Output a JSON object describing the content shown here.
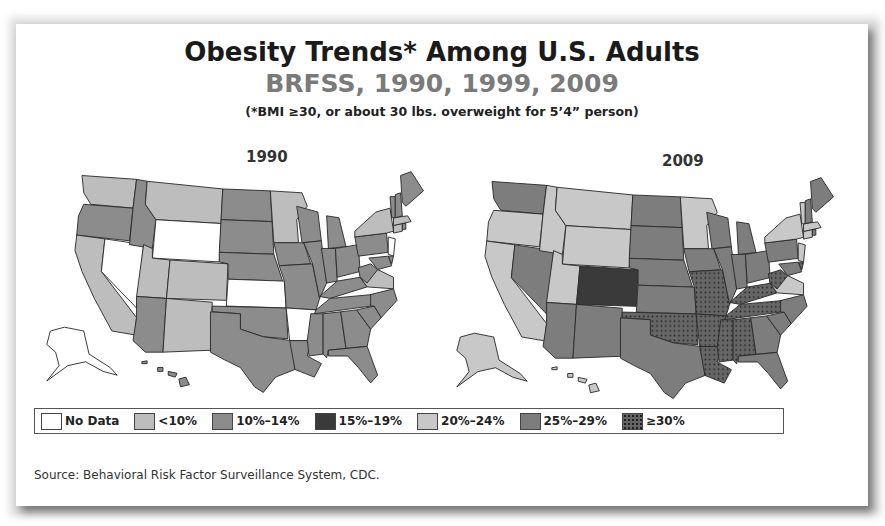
{
  "slide": {
    "title": "Obesity Trends* Among U.S. Adults",
    "subtitle": "BRFSS, 1990, 1999, 2009",
    "note": "(*BMI ≥30, or about 30 lbs. overweight for 5’4” person)",
    "source": "Source: Behavioral Risk Factor Surveillance System, CDC."
  },
  "colors": {
    "no_data": "#ffffff",
    "lt10": "#bdbdbd",
    "10_14": "#8c8c8c",
    "15_19": "#3a3a3a",
    "20_24": "#c8c8c8",
    "25_29": "#7d7d7d",
    "gte30": "#555555"
  },
  "chart_data": {
    "type": "choropleth",
    "title": "Obesity Trends* Among U.S. Adults",
    "subtitle": "BRFSS, 1990, 1999, 2009",
    "note": "(*BMI ≥30, or about 30 lbs. overweight for 5’4” person)",
    "legend": [
      {
        "key": "no_data",
        "label": "No Data"
      },
      {
        "key": "lt10",
        "label": "<10%"
      },
      {
        "key": "10_14",
        "label": "10%–14%"
      },
      {
        "key": "15_19",
        "label": "15%–19%"
      },
      {
        "key": "20_24",
        "label": "20%–24%"
      },
      {
        "key": "25_29",
        "label": "25%–29%"
      },
      {
        "key": "gte30",
        "label": "≥30%"
      }
    ],
    "maps": [
      {
        "year": "1990",
        "states": {
          "WA": "lt10",
          "OR": "10_14",
          "CA": "lt10",
          "NV": "no_data",
          "ID": "10_14",
          "MT": "lt10",
          "WY": "no_data",
          "UT": "lt10",
          "CO": "lt10",
          "AZ": "10_14",
          "NM": "lt10",
          "ND": "10_14",
          "SD": "10_14",
          "NE": "10_14",
          "KS": "no_data",
          "OK": "10_14",
          "TX": "10_14",
          "MN": "lt10",
          "IA": "10_14",
          "MO": "10_14",
          "AR": "no_data",
          "LA": "10_14",
          "WI": "10_14",
          "IL": "10_14",
          "MI": "10_14",
          "IN": "10_14",
          "OH": "10_14",
          "KY": "10_14",
          "TN": "10_14",
          "MS": "10_14",
          "AL": "10_14",
          "GA": "10_14",
          "FL": "10_14",
          "SC": "10_14",
          "NC": "10_14",
          "VA": "lt10",
          "WV": "10_14",
          "PA": "10_14",
          "NY": "lt10",
          "NJ": "no_data",
          "DE": "10_14",
          "MD": "10_14",
          "CT": "lt10",
          "RI": "10_14",
          "MA": "lt10",
          "VT": "10_14",
          "NH": "10_14",
          "ME": "10_14",
          "AK": "no_data",
          "HI": "10_14"
        }
      },
      {
        "year": "2009",
        "states": {
          "WA": "25_29",
          "OR": "20_24",
          "CA": "20_24",
          "NV": "25_29",
          "ID": "20_24",
          "MT": "20_24",
          "WY": "20_24",
          "UT": "20_24",
          "CO": "15_19",
          "AZ": "25_29",
          "NM": "25_29",
          "ND": "25_29",
          "SD": "25_29",
          "NE": "25_29",
          "KS": "25_29",
          "OK": "gte30",
          "TX": "25_29",
          "MN": "20_24",
          "IA": "25_29",
          "MO": "gte30",
          "AR": "gte30",
          "LA": "gte30",
          "WI": "25_29",
          "IL": "25_29",
          "MI": "25_29",
          "IN": "25_29",
          "OH": "25_29",
          "KY": "gte30",
          "TN": "gte30",
          "MS": "gte30",
          "AL": "gte30",
          "GA": "25_29",
          "FL": "25_29",
          "SC": "25_29",
          "NC": "25_29",
          "VA": "20_24",
          "WV": "gte30",
          "PA": "25_29",
          "NY": "20_24",
          "NJ": "20_24",
          "DE": "gte30",
          "MD": "25_29",
          "CT": "20_24",
          "RI": "25_29",
          "MA": "20_24",
          "VT": "20_24",
          "NH": "25_29",
          "ME": "25_29",
          "AK": "20_24",
          "HI": "20_24"
        }
      }
    ]
  },
  "legend": {
    "items": [
      {
        "label": "No Data"
      },
      {
        "label": "<10%"
      },
      {
        "label": "10%–14%"
      },
      {
        "label": "15%–19%"
      },
      {
        "label": "20%–24%"
      },
      {
        "label": "25%–29%"
      },
      {
        "label": "≥30%"
      }
    ]
  },
  "maps": {
    "left_label": "1990",
    "right_label": "2009"
  }
}
